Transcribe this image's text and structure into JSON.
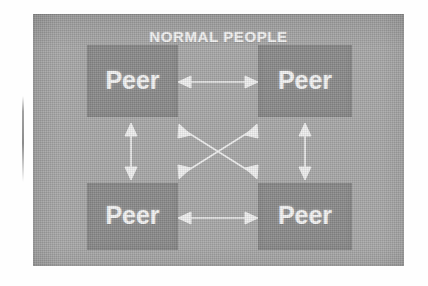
{
  "figure": {
    "title": "NORMAL PEOPLE",
    "style": {
      "page_background": "#ffffff",
      "panel_background": "#a9a9a9",
      "node_background": "#8b8b8b",
      "text_color": "#f4f4f4",
      "arrow_color": "#f0f0f0"
    }
  },
  "nodes": [
    {
      "id": "peer-top-left",
      "label": "Peer",
      "position": "top-left"
    },
    {
      "id": "peer-top-right",
      "label": "Peer",
      "position": "top-right"
    },
    {
      "id": "peer-bottom-left",
      "label": "Peer",
      "position": "bottom-left"
    },
    {
      "id": "peer-bottom-right",
      "label": "Peer",
      "position": "bottom-right"
    }
  ],
  "connections": [
    {
      "id": "top-horizontal",
      "from": "peer-top-left",
      "to": "peer-top-right",
      "arrow": "double"
    },
    {
      "id": "bottom-horizontal",
      "from": "peer-bottom-left",
      "to": "peer-bottom-right",
      "arrow": "double"
    },
    {
      "id": "left-vertical",
      "from": "peer-top-left",
      "to": "peer-bottom-left",
      "arrow": "double"
    },
    {
      "id": "right-vertical",
      "from": "peer-top-right",
      "to": "peer-bottom-right",
      "arrow": "double"
    },
    {
      "id": "diagonal-tl-br",
      "from": "peer-top-left",
      "to": "peer-bottom-right",
      "arrow": "double"
    },
    {
      "id": "diagonal-tr-bl",
      "from": "peer-top-right",
      "to": "peer-bottom-left",
      "arrow": "double"
    }
  ]
}
